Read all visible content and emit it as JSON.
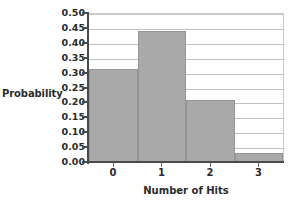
{
  "chart_data": {
    "type": "bar",
    "title": "",
    "subtitle": "",
    "xlabel": "Number of Hits",
    "ylabel": "Probability",
    "categories": [
      "0",
      "1",
      "2",
      "3"
    ],
    "values": [
      0.315,
      0.443,
      0.21,
      0.035
    ],
    "series": [
      {
        "name": "Probability",
        "values": [
          0.315,
          0.443,
          0.21,
          0.035
        ]
      }
    ],
    "ylim": [
      0.0,
      0.5
    ],
    "ytick_labels": [
      "0.50",
      "0.45",
      "0.40",
      "0.35",
      "0.30",
      "0.25",
      "0.20",
      "0.15",
      "0.10",
      "0.05",
      "0.00"
    ],
    "ytick_values": [
      0.5,
      0.45,
      0.4,
      0.35,
      0.3,
      0.25,
      0.2,
      0.15,
      0.1,
      0.05,
      0.0
    ],
    "grid": true,
    "grid_axis": "y",
    "legend": false,
    "legend_position": "none",
    "bar_color": "#a9a9a9",
    "bar_border_color": "#949494",
    "gridline_color": "#c0c0c0",
    "axis_color": "#4a4a4a",
    "text_color": "#2b2b2b",
    "background_color": "#ffffff"
  }
}
